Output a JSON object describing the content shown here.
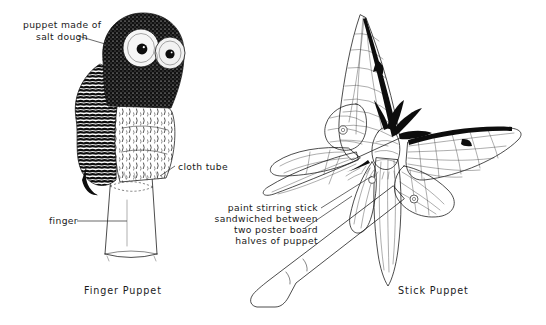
{
  "figure": {
    "background_color": "#ffffff",
    "ink_color": "#111111"
  },
  "labels": {
    "salt_dough": {
      "line1": "puppet made of",
      "line2": "salt dough"
    },
    "cloth_tube": "cloth tube",
    "finger": "finger",
    "stick": {
      "line1": "paint stirring stick",
      "line2": "sandwiched between",
      "line3": "two poster board",
      "line4": "halves of puppet"
    }
  },
  "captions": {
    "left": "Finger Puppet",
    "right": "Stick Puppet"
  },
  "subjects": {
    "left": "owl-finger-puppet",
    "right": "moth-stick-puppet"
  }
}
